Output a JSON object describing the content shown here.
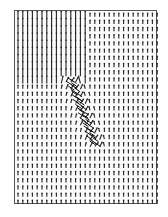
{
  "figure": {
    "title": "",
    "type": "vector-field (quiver) plot",
    "frame_color": "#555555",
    "arrow_color": "#222222",
    "background": "#ffffff"
  },
  "grid": {
    "columns": 30,
    "rows": 27,
    "col_spacing_px": 4.8,
    "row_spacing_px": 7.2
  },
  "regions": {
    "upper_left_long_vertical": {
      "x_max_col": 14,
      "y_max_row": 9,
      "arrow_length": 7.2,
      "direction": "up"
    },
    "elsewhere_short_vertical": {
      "arrow_length": 3.6,
      "direction": "up"
    },
    "diagonal_disturbance": {
      "description": "dense cluster of tilted arrows along a diagonal line",
      "from_col": 11,
      "from_row": 9,
      "to_col": 16,
      "to_row": 18
    }
  }
}
